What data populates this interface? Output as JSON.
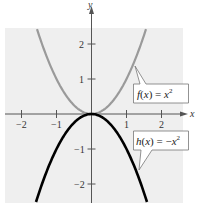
{
  "chart_data": {
    "type": "line",
    "title": "",
    "xlabel": "x",
    "ylabel": "y",
    "xlim": [
      -2.5,
      2.6
    ],
    "ylim": [
      -2.5,
      2.6
    ],
    "grid": false,
    "x_ticks": [
      -2,
      -1,
      1,
      2
    ],
    "y_ticks": [
      2,
      1,
      -1,
      -2
    ],
    "x_tick_labels": [
      "−2",
      "−1",
      "1",
      "2"
    ],
    "y_tick_labels": [
      "2",
      "1",
      "−1",
      "−2"
    ],
    "series": [
      {
        "name": "f(x) = x^2",
        "label_main": "f(x) = x",
        "label_sup": "2",
        "expression": "x^2",
        "color": "#9a9a9a",
        "x": [
          -1.5,
          -1,
          -0.5,
          0,
          0.5,
          1,
          1.5
        ],
        "y": [
          2.25,
          1,
          0.25,
          0,
          0.25,
          1,
          2.25
        ]
      },
      {
        "name": "h(x) = -x^2",
        "label_main": "h(x) = −x",
        "label_sup": "2",
        "expression": "-x^2",
        "color": "#000000",
        "x": [
          -1.5,
          -1,
          -0.5,
          0,
          0.5,
          1,
          1.5
        ],
        "y": [
          -2.25,
          -1,
          -0.25,
          0,
          -0.25,
          -1,
          -2.25
        ]
      }
    ],
    "annotations": [
      {
        "text": "f(x) = x^2",
        "points_to": "f curve near x=1.2"
      },
      {
        "text": "h(x) = -x^2",
        "points_to": "h curve near x=1.35"
      }
    ]
  },
  "colors": {
    "background_panel": "#efefef",
    "axis": "#555555",
    "f_curve": "#9a9a9a",
    "h_curve": "#000000"
  }
}
